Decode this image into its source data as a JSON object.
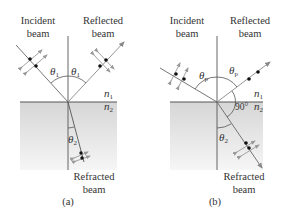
{
  "figure": {
    "panels": [
      {
        "id": "a",
        "caption": "(a)",
        "labels": {
          "incident_line1": "Incident",
          "incident_line2": "beam",
          "reflected_line1": "Reflected",
          "reflected_line2": "beam",
          "refracted_line1": "Refracted",
          "refracted_line2": "beam"
        },
        "angles": {
          "incident": "θ",
          "incident_sub": "1",
          "reflected": "θ",
          "reflected_sub": "1",
          "refracted": "θ",
          "refracted_sub": "2"
        },
        "media": {
          "upper": "n",
          "upper_sub": "1",
          "lower": "n",
          "lower_sub": "2"
        }
      },
      {
        "id": "b",
        "caption": "(b)",
        "labels": {
          "incident_line1": "Incident",
          "incident_line2": "beam",
          "reflected_line1": "Reflected",
          "reflected_line2": "beam",
          "refracted_line1": "Refracted",
          "refracted_line2": "beam"
        },
        "angles": {
          "incident": "θ",
          "incident_sub": "p",
          "reflected": "θ",
          "reflected_sub": "p",
          "refracted": "θ",
          "refracted_sub": "2",
          "right_angle": "90°"
        },
        "media": {
          "upper": "n",
          "upper_sub": "1",
          "lower": "n",
          "lower_sub": "2"
        }
      }
    ],
    "colors": {
      "line": "#555555",
      "arrow": "#888888",
      "dot": "#111111",
      "medium_top": "#d8d8d8",
      "medium_bottom": "#f4f4f4"
    }
  }
}
